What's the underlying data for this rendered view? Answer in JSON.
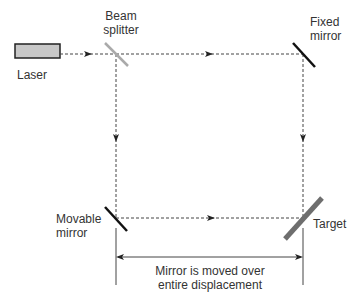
{
  "diagram": {
    "type": "optical-interferometer-setup",
    "labels": {
      "laser": "Laser",
      "beam_splitter_line1": "Beam",
      "beam_splitter_line2": "splitter",
      "fixed_mirror_line1": "Fixed",
      "fixed_mirror_line2": "mirror",
      "movable_mirror_line1": "Movable",
      "movable_mirror_line2": "mirror",
      "target": "Target",
      "displacement_line1": "Mirror is moved over",
      "displacement_line2": "entire displacement"
    },
    "colors": {
      "laser_fill": "#c8c8c8",
      "laser_stroke": "#222222",
      "beam_splitter": "#aaaaaa",
      "mirror": "#111111",
      "target": "#6e6e6e",
      "beam": "#444444",
      "text": "#333333"
    }
  }
}
